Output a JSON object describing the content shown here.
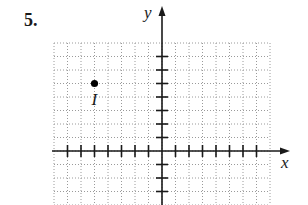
{
  "problem": {
    "number": "5."
  },
  "chart_data": {
    "type": "scatter",
    "title": "",
    "xlabel": "x",
    "ylabel": "y",
    "grid": true,
    "grid_style": "dotted",
    "xlim": [
      -8,
      8
    ],
    "ylim": [
      -4,
      8
    ],
    "x_ticks": [
      -7,
      -6,
      -5,
      -4,
      -3,
      -2,
      -1,
      1,
      2,
      3,
      4,
      5,
      6,
      7
    ],
    "y_ticks": [
      -3,
      -2,
      -1,
      1,
      2,
      3,
      4,
      5,
      6,
      7
    ],
    "tick_labels_shown": false,
    "points": [
      {
        "label": "I",
        "x": -5,
        "y": 5
      }
    ]
  },
  "labels": {
    "x_axis": "x",
    "y_axis": "y",
    "point": "I"
  },
  "colors": {
    "axis": "#1a1a1a",
    "grid": "#9a9a9a",
    "point": "#000000"
  }
}
